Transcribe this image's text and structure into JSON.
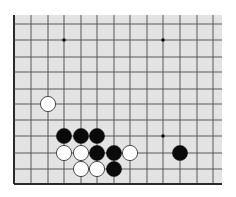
{
  "diagram": {
    "type": "go-board-fragment",
    "colors": {
      "page_background": "#ffffff",
      "board": "#e3e3e3",
      "grid_line": "#4a4a4a",
      "edge_line": "#2a2a2a",
      "black_stone": "#0a0a0a",
      "white_stone": "#ffffff",
      "white_stone_outline": "#3a3a3a"
    },
    "board_area": {
      "x": 14,
      "y": 15,
      "width": 208,
      "height": 169
    },
    "grid": {
      "columns_x": [
        14,
        31,
        48,
        64,
        81,
        97,
        114,
        130,
        147,
        163,
        180,
        197,
        213
      ],
      "rows_y": [
        24,
        40,
        57,
        72,
        89,
        104,
        120,
        136,
        153,
        169,
        184
      ],
      "edges": {
        "left": true,
        "bottom": true,
        "top": false,
        "right": false
      }
    },
    "star_points": [
      {
        "col": 3,
        "row": 1
      },
      {
        "col": 9,
        "row": 1
      },
      {
        "col": 9,
        "row": 7
      }
    ],
    "stones": [
      {
        "color": "white",
        "col": 2,
        "row": 5
      },
      {
        "color": "black",
        "col": 3,
        "row": 7
      },
      {
        "color": "black",
        "col": 4,
        "row": 7
      },
      {
        "color": "black",
        "col": 5,
        "row": 7
      },
      {
        "color": "white",
        "col": 3,
        "row": 8
      },
      {
        "color": "white",
        "col": 4,
        "row": 8
      },
      {
        "color": "black",
        "col": 5,
        "row": 8
      },
      {
        "color": "black",
        "col": 6,
        "row": 8
      },
      {
        "color": "white",
        "col": 7,
        "row": 8
      },
      {
        "color": "black",
        "col": 10,
        "row": 8
      },
      {
        "color": "white",
        "col": 4,
        "row": 9
      },
      {
        "color": "white",
        "col": 5,
        "row": 9
      },
      {
        "color": "black",
        "col": 6,
        "row": 9
      }
    ],
    "stone_radius": 7.6,
    "star_radius": 1.8
  }
}
